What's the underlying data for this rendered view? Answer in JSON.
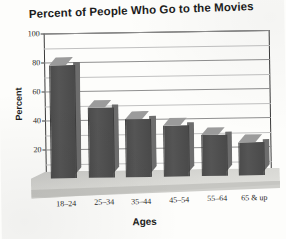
{
  "chart_data": {
    "type": "bar",
    "title": "Percent of People Who Go to the Movies",
    "xlabel": "Ages",
    "ylabel": "Percent",
    "categories": [
      "18–24",
      "25–34",
      "35–44",
      "45–54",
      "55–64",
      "65 & up"
    ],
    "values": [
      78,
      48,
      40,
      35,
      28,
      23
    ],
    "ylim": [
      0,
      100
    ],
    "yticks": [
      0,
      20,
      40,
      60,
      80,
      100
    ],
    "ytick_labels": [
      "0",
      "20",
      "40",
      "60",
      "80",
      "100"
    ],
    "minor_ticks": [
      10,
      30,
      50,
      70,
      90
    ],
    "grid": true,
    "legend": "none",
    "style": "3d-bar",
    "colors": {
      "bar_front": "#4d4d4d",
      "bar_top": "#9b9b9b",
      "bar_side": "#6d6d6d",
      "floor": "#d8d8d4",
      "gridline": "#8f8f8f",
      "axis": "#3a3a3a",
      "text": "#1c1c1c",
      "background": "#fdfdfb"
    }
  }
}
